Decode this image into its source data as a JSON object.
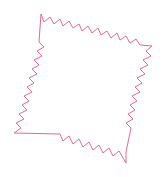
{
  "figure": {
    "background_color": "#ffffff",
    "stroke_color": "#e26a8d",
    "stroke_width": 1,
    "fill": "none",
    "canvas": {
      "width": 168,
      "height": 177
    }
  },
  "chart_data": {
    "type": "line",
    "xlabel": "",
    "ylabel": "",
    "xlim": [
      0,
      168
    ],
    "ylim": [
      0,
      177
    ],
    "grid": false,
    "legend": null,
    "closed": true,
    "series": [
      {
        "name": "zigzag-outline",
        "color": "#e26a8d",
        "points": [
          [
            41,
            14
          ],
          [
            44,
            22
          ],
          [
            50,
            17
          ],
          [
            54,
            24
          ],
          [
            60,
            19
          ],
          [
            63,
            26
          ],
          [
            69,
            21
          ],
          [
            73,
            28
          ],
          [
            79,
            24
          ],
          [
            82,
            31
          ],
          [
            88,
            26
          ],
          [
            92,
            33
          ],
          [
            98,
            28
          ],
          [
            101,
            35
          ],
          [
            107,
            31
          ],
          [
            111,
            38
          ],
          [
            117,
            33
          ],
          [
            120,
            40
          ],
          [
            126,
            36
          ],
          [
            130,
            43
          ],
          [
            136,
            39
          ],
          [
            140,
            45
          ],
          [
            152,
            46
          ],
          [
            146,
            51
          ],
          [
            151,
            56
          ],
          [
            143,
            60
          ],
          [
            148,
            65
          ],
          [
            140,
            69
          ],
          [
            145,
            74
          ],
          [
            137,
            78
          ],
          [
            142,
            83
          ],
          [
            135,
            87
          ],
          [
            140,
            92
          ],
          [
            132,
            96
          ],
          [
            137,
            101
          ],
          [
            130,
            105
          ],
          [
            135,
            110
          ],
          [
            128,
            114
          ],
          [
            133,
            119
          ],
          [
            126,
            123
          ],
          [
            131,
            128
          ],
          [
            126,
            152
          ],
          [
            126,
            163
          ],
          [
            119,
            151
          ],
          [
            113,
            156
          ],
          [
            109,
            148
          ],
          [
            103,
            153
          ],
          [
            99,
            145
          ],
          [
            93,
            150
          ],
          [
            89,
            142
          ],
          [
            83,
            147
          ],
          [
            79,
            139
          ],
          [
            73,
            144
          ],
          [
            69,
            136
          ],
          [
            63,
            141
          ],
          [
            60,
            134
          ],
          [
            14,
            133
          ],
          [
            21,
            128
          ],
          [
            16,
            123
          ],
          [
            24,
            119
          ],
          [
            19,
            114
          ],
          [
            27,
            110
          ],
          [
            22,
            105
          ],
          [
            29,
            101
          ],
          [
            24,
            96
          ],
          [
            32,
            92
          ],
          [
            27,
            87
          ],
          [
            34,
            83
          ],
          [
            29,
            78
          ],
          [
            37,
            74
          ],
          [
            32,
            69
          ],
          [
            39,
            65
          ],
          [
            34,
            60
          ],
          [
            42,
            56
          ],
          [
            37,
            51
          ],
          [
            44,
            47
          ],
          [
            39,
            42
          ],
          [
            41,
            14
          ]
        ]
      }
    ]
  }
}
